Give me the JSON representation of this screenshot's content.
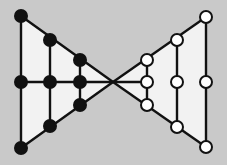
{
  "diagram": {
    "colors": {
      "background": "#c9c9c9",
      "fill": "#f2f2f2",
      "line": "#111111",
      "black_node": "#111111",
      "white_node": "#ffffff"
    },
    "apex": [
      113,
      82
    ],
    "left_nodes": [
      [
        21,
        16
      ],
      [
        50,
        40
      ],
      [
        80,
        60
      ],
      [
        21,
        82
      ],
      [
        50,
        82
      ],
      [
        80,
        82
      ],
      [
        80,
        105
      ],
      [
        50,
        126
      ],
      [
        21,
        148
      ]
    ],
    "right_nodes": [
      [
        206,
        17
      ],
      [
        177,
        40
      ],
      [
        147,
        60
      ],
      [
        147,
        82
      ],
      [
        177,
        82
      ],
      [
        206,
        82
      ],
      [
        147,
        105
      ],
      [
        177,
        127
      ],
      [
        206,
        147
      ]
    ]
  }
}
